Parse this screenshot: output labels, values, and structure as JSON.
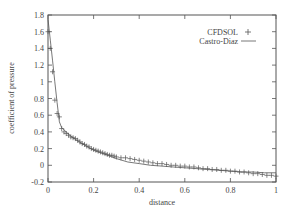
{
  "chart_data": {
    "type": "line",
    "title": "",
    "xlabel": "distance",
    "ylabel": "coefficient of pressure",
    "xlim": [
      0,
      1
    ],
    "ylim": [
      -0.2,
      1.8
    ],
    "xticks": [
      "0",
      "0.2",
      "0.4",
      "0.6",
      "0.8",
      "1"
    ],
    "yticks": [
      "-0.2",
      "0",
      "0.2",
      "0.4",
      "0.6",
      "0.8",
      "1",
      "1.2",
      "1.4",
      "1.6",
      "1.8"
    ],
    "grid": false,
    "legend_position": "upper right",
    "series": [
      {
        "name": "CFDSOL",
        "style": "points",
        "marker": "+",
        "x": [
          0.0,
          0.01,
          0.02,
          0.03,
          0.04,
          0.05,
          0.06,
          0.07,
          0.08,
          0.09,
          0.1,
          0.11,
          0.12,
          0.13,
          0.14,
          0.15,
          0.16,
          0.17,
          0.18,
          0.19,
          0.2,
          0.21,
          0.22,
          0.23,
          0.24,
          0.25,
          0.26,
          0.27,
          0.28,
          0.29,
          0.3,
          0.32,
          0.34,
          0.36,
          0.38,
          0.4,
          0.42,
          0.44,
          0.46,
          0.48,
          0.5,
          0.52,
          0.54,
          0.56,
          0.58,
          0.6,
          0.62,
          0.64,
          0.66,
          0.68,
          0.7,
          0.72,
          0.74,
          0.76,
          0.78,
          0.8,
          0.82,
          0.84,
          0.86,
          0.88,
          0.9,
          0.92,
          0.94,
          0.96,
          0.98,
          1.0
        ],
        "y": [
          1.6,
          1.4,
          1.12,
          0.78,
          0.62,
          0.58,
          0.44,
          0.4,
          0.38,
          0.36,
          0.34,
          0.33,
          0.32,
          0.3,
          0.28,
          0.26,
          0.25,
          0.23,
          0.22,
          0.2,
          0.19,
          0.18,
          0.17,
          0.16,
          0.15,
          0.14,
          0.13,
          0.12,
          0.12,
          0.11,
          0.1,
          0.09,
          0.09,
          0.08,
          0.07,
          0.06,
          0.05,
          0.04,
          0.03,
          0.02,
          0.02,
          0.01,
          0.0,
          0.0,
          -0.01,
          -0.01,
          -0.02,
          -0.02,
          -0.03,
          -0.04,
          -0.04,
          -0.05,
          -0.05,
          -0.06,
          -0.06,
          -0.07,
          -0.07,
          -0.08,
          -0.08,
          -0.09,
          -0.1,
          -0.1,
          -0.11,
          -0.12,
          -0.12,
          -0.13
        ]
      },
      {
        "name": "Castro-Diaz",
        "style": "line",
        "x": [
          0.0,
          0.01,
          0.02,
          0.03,
          0.04,
          0.05,
          0.06,
          0.08,
          0.1,
          0.12,
          0.15,
          0.2,
          0.25,
          0.3,
          0.35,
          0.4,
          0.45,
          0.5,
          0.55,
          0.6,
          0.65,
          0.7,
          0.75,
          0.8,
          0.85,
          0.9,
          0.95,
          1.0
        ],
        "y": [
          1.75,
          1.5,
          1.25,
          1.0,
          0.75,
          0.52,
          0.45,
          0.4,
          0.35,
          0.31,
          0.26,
          0.18,
          0.13,
          0.08,
          0.04,
          0.02,
          0.0,
          -0.01,
          -0.02,
          -0.03,
          -0.04,
          -0.05,
          -0.06,
          -0.07,
          -0.08,
          -0.08,
          -0.09,
          -0.09
        ]
      }
    ]
  },
  "colors": {
    "axis": "#555555",
    "series": "#555555"
  }
}
